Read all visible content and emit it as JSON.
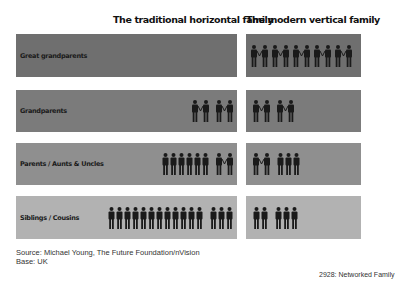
{
  "headers": {
    "traditional": "The traditional horizontal family",
    "modern": "The modern vertical family"
  },
  "colors": {
    "row_backgrounds": [
      "#6f6f6f",
      "#7b7b7b",
      "#8f8f8f",
      "#b2b2b2"
    ],
    "figure": "#1a1a1a"
  },
  "rows": [
    {
      "label": "Great grandparents",
      "traditional": [],
      "modern": [
        {
          "type": "couple",
          "count": 5
        }
      ]
    },
    {
      "label": "Grandparents",
      "traditional": [
        {
          "type": "couple",
          "count": 1
        },
        {
          "type": "couple",
          "count": 1
        }
      ],
      "modern": [
        {
          "type": "couple",
          "count": 1
        },
        {
          "type": "couple",
          "count": 1
        }
      ]
    },
    {
      "label": "Parents / Aunts & Uncles",
      "traditional": [
        {
          "type": "single",
          "count": 6
        },
        {
          "type": "couple",
          "count": 1
        }
      ],
      "modern": [
        {
          "type": "couple",
          "count": 1
        },
        {
          "type": "single",
          "count": 3
        }
      ]
    },
    {
      "label": "Siblings / Cousins",
      "traditional": [
        {
          "type": "single",
          "count": 12
        },
        {
          "type": "single",
          "count": 3
        }
      ],
      "modern": [
        {
          "type": "single",
          "count": 2
        },
        {
          "type": "single",
          "count": 3
        }
      ]
    }
  ],
  "footer": {
    "source": "Source: Michael Young, The Future Foundation/nVision",
    "base": "Base: UK",
    "reference": "2928: Networked Family"
  }
}
